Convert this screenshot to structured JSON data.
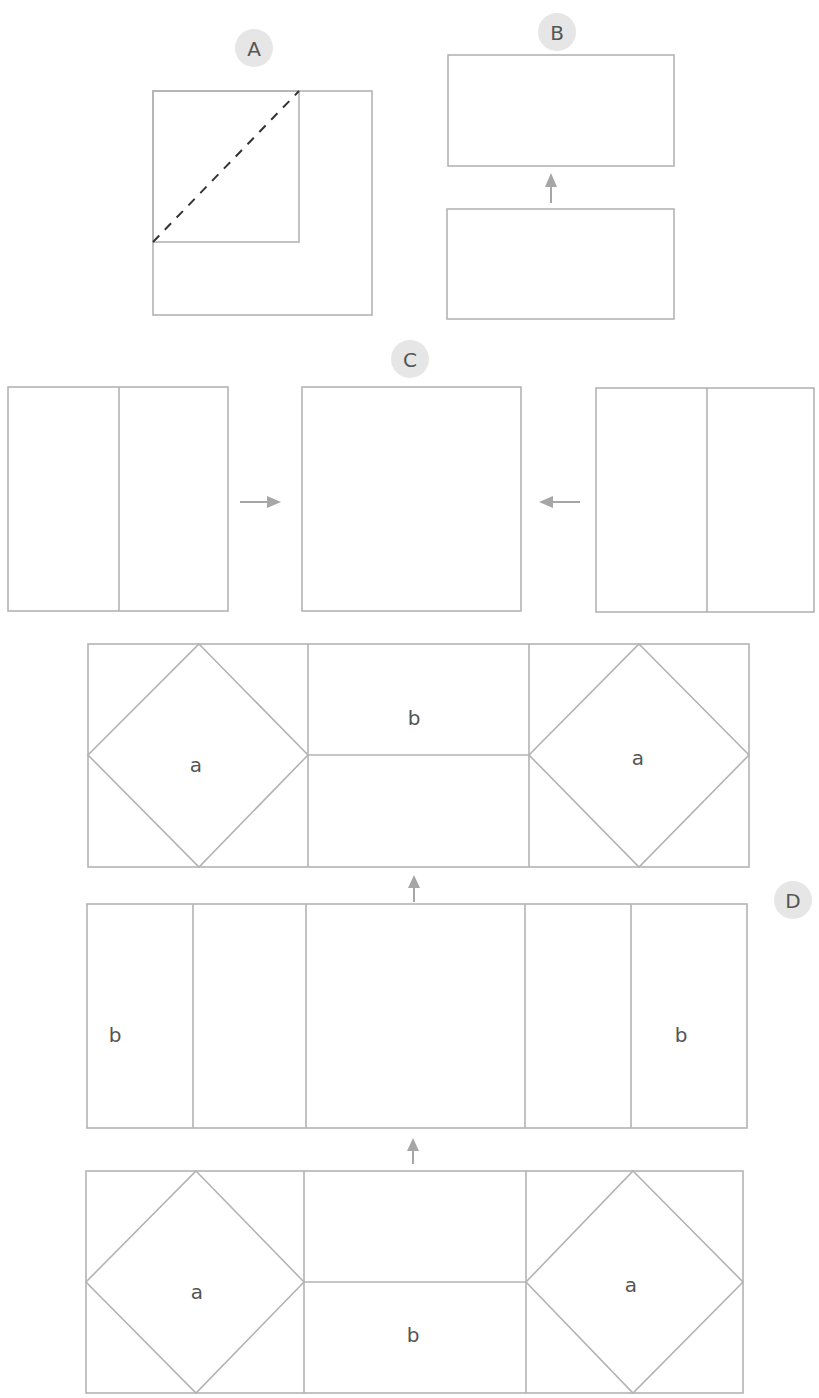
{
  "steps": {
    "A": {
      "label": "A"
    },
    "B": {
      "label": "B"
    },
    "C": {
      "label": "C"
    },
    "D": {
      "label": "D"
    }
  },
  "piece_labels": {
    "d_top": {
      "left": "a",
      "center": "b",
      "right": "a"
    },
    "d_middle": {
      "left": "b",
      "right": "b"
    },
    "d_bottom": {
      "left": "a",
      "center": "b",
      "right": "a"
    }
  },
  "colors": {
    "outline": "#b3b3b3",
    "fold_line": "#333333",
    "arrow": "#a6a6a6",
    "badge": "#e6e6e6"
  }
}
